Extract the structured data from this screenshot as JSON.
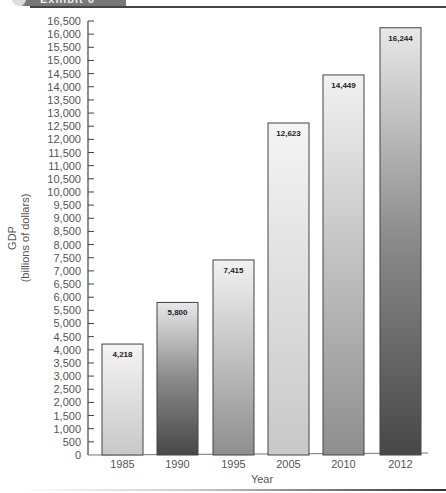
{
  "header": {
    "title": "Exhibit 6"
  },
  "chart_data": {
    "type": "bar",
    "title": "",
    "xlabel": "Year",
    "ylabel": "GDP (billions of dollars)",
    "ylabel_lines": [
      "GDP",
      "(billions of dollars)"
    ],
    "categories": [
      "1985",
      "1990",
      "1995",
      "2005",
      "2010",
      "2012"
    ],
    "values": [
      4218,
      5800,
      7415,
      12623,
      14449,
      16244
    ],
    "value_labels": [
      "4,218",
      "5,800",
      "7,415",
      "12,623",
      "14,449",
      "16,244"
    ],
    "ylim": [
      0,
      16500
    ],
    "ytick_step": 500,
    "grid": false,
    "legend": "none",
    "bar_fill_styles": [
      "light",
      "dark",
      "medium",
      "light",
      "medium",
      "dark"
    ]
  }
}
